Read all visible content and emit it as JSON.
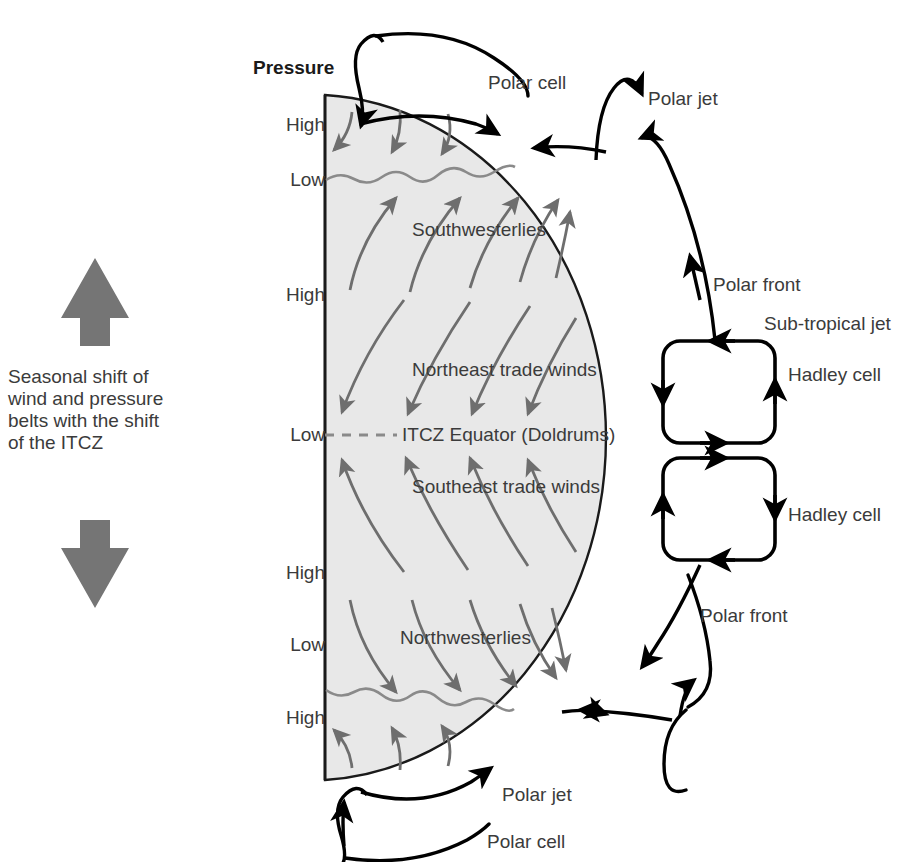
{
  "diagram": {
    "title_label": "Pressure",
    "seasonal_note": "Seasonal shift of wind and pressure belts with the shift of the ITCZ",
    "colors": {
      "hemisphere_fill": "#e8e8e8",
      "hemisphere_stroke": "#1a1a1a",
      "wind_arrow": "#6e6e6e",
      "front_wave": "#8a8a8a",
      "cell_stroke": "#000000",
      "text": "#3b3b3b",
      "shift_arrow": "#757575"
    },
    "pressure_belts": [
      {
        "label": "High",
        "y": 125
      },
      {
        "label": "Low",
        "y": 180
      },
      {
        "label": "High",
        "y": 295
      },
      {
        "label": "Low",
        "y": 435
      },
      {
        "label": "High",
        "y": 573
      },
      {
        "label": "Low",
        "y": 645
      },
      {
        "label": "High",
        "y": 718
      }
    ],
    "wind_belts": [
      {
        "name": "Southwesterlies",
        "x": 412,
        "y": 230
      },
      {
        "name": "Northeast trade winds",
        "x": 412,
        "y": 370
      },
      {
        "name": "ITCZ Equator (Doldrums)",
        "x": 402,
        "y": 427
      },
      {
        "name": "Southeast trade winds",
        "x": 412,
        "y": 487
      },
      {
        "name": "Northwesterlies",
        "x": 400,
        "y": 638
      }
    ],
    "circulation_labels": [
      {
        "name": "Polar cell",
        "x": 488,
        "y": 73
      },
      {
        "name": "Polar jet",
        "x": 648,
        "y": 89
      },
      {
        "name": "Polar front",
        "x": 713,
        "y": 280
      },
      {
        "name": "Sub-tropical jet",
        "x": 765,
        "y": 320
      },
      {
        "name": "Hadley cell",
        "x": 788,
        "y": 370
      },
      {
        "name": "Hadley cell",
        "x": 788,
        "y": 510
      },
      {
        "name": "Polar front",
        "x": 700,
        "y": 611
      },
      {
        "name": "Polar jet",
        "x": 502,
        "y": 790
      },
      {
        "name": "Polar cell",
        "x": 487,
        "y": 838
      }
    ],
    "shift_arrows": [
      {
        "name": "seasonal-shift-up-arrow",
        "direction": "up"
      },
      {
        "name": "seasonal-shift-down-arrow",
        "direction": "down"
      }
    ],
    "hemisphere": {
      "left_x": 325,
      "top_y": 95,
      "equator_y": 435,
      "bottom_y": 780,
      "bulge_x": 622
    }
  }
}
